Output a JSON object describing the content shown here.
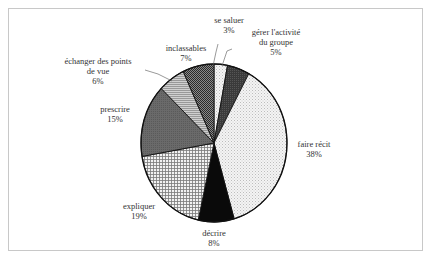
{
  "chart_data": {
    "type": "pie",
    "title": "",
    "start_angle_deg": 0,
    "direction": "clockwise",
    "slices": [
      {
        "label": "se saluer",
        "value": 3,
        "pct_label": "3%",
        "fill": "dots-light"
      },
      {
        "label": "gérer l'activité du groupe",
        "value": 5,
        "pct_label": "5%",
        "fill": "dark-grey"
      },
      {
        "label": "faire récit",
        "value": 38,
        "pct_label": "38%",
        "fill": "dots-light"
      },
      {
        "label": "décrire",
        "value": 8,
        "pct_label": "8%",
        "fill": "black"
      },
      {
        "label": "expliquer",
        "value": 19,
        "pct_label": "19%",
        "fill": "grid"
      },
      {
        "label": "prescrire",
        "value": 15,
        "pct_label": "15%",
        "fill": "mid-grey"
      },
      {
        "label": "échanger des points de vue",
        "value": 6,
        "pct_label": "6%",
        "fill": "hlines"
      },
      {
        "label": "inclassables",
        "value": 7,
        "pct_label": "7%",
        "fill": "checker-dark"
      }
    ]
  },
  "labels": {
    "se_saluer": {
      "line1": "se saluer",
      "pct": "3%"
    },
    "gerer": {
      "line1": "gérer l'activité",
      "line2": "du groupe",
      "pct": "5%"
    },
    "faire_recit": {
      "line1": "faire récit",
      "pct": "38%"
    },
    "decrire": {
      "line1": "décrire",
      "pct": "8%"
    },
    "expliquer": {
      "line1": "expliquer",
      "pct": "19%"
    },
    "prescrire": {
      "line1": "prescrire",
      "pct": "15%"
    },
    "echanger": {
      "line1": "échanger des points",
      "line2": "de vue",
      "pct": "6%"
    },
    "inclassables": {
      "line1": "inclassables",
      "pct": "7%"
    }
  }
}
